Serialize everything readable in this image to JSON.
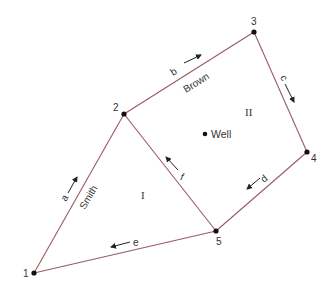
{
  "diagram": {
    "type": "pipe-network",
    "colors": {
      "line": "#9a5a60",
      "node": "#111111",
      "text": "#333333",
      "arrow": "#222222"
    },
    "nodes": [
      {
        "id": "1",
        "label": "1",
        "x": 34,
        "y": 273
      },
      {
        "id": "2",
        "label": "2",
        "x": 124,
        "y": 114
      },
      {
        "id": "3",
        "label": "3",
        "x": 254,
        "y": 32
      },
      {
        "id": "4",
        "label": "4",
        "x": 307,
        "y": 152
      },
      {
        "id": "5",
        "label": "5",
        "x": 216,
        "y": 231
      }
    ],
    "edges": [
      {
        "id": "a",
        "label": "a",
        "from": "1",
        "to": "2",
        "name": "Smith"
      },
      {
        "id": "b",
        "label": "b",
        "from": "2",
        "to": "3",
        "name": "Brown"
      },
      {
        "id": "c",
        "label": "c",
        "from": "3",
        "to": "4",
        "name": ""
      },
      {
        "id": "d",
        "label": "d",
        "from": "4",
        "to": "5",
        "name": ""
      },
      {
        "id": "e",
        "label": "e",
        "from": "5",
        "to": "1",
        "name": ""
      },
      {
        "id": "f",
        "label": "f",
        "from": "5",
        "to": "2",
        "name": ""
      }
    ],
    "loops": [
      {
        "label": "I"
      },
      {
        "label": "II"
      }
    ],
    "well": {
      "label": "Well"
    }
  }
}
